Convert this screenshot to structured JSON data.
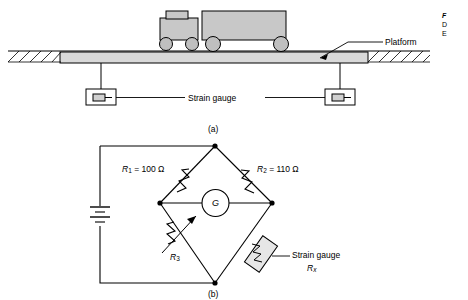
{
  "figure": {
    "part_a": {
      "caption": "(a)",
      "platform_label": "Platform",
      "strain_gauge_label": "Strain gauge"
    },
    "part_b": {
      "caption": "(b)",
      "r1_label": "R",
      "r1_sub": "1",
      "r1_value": " = 100 Ω",
      "r2_label": "R",
      "r2_sub": "2",
      "r2_value": " = 110 Ω",
      "r3_label": "R",
      "r3_sub": "3",
      "galvanometer_label": "G",
      "strain_gauge_label": "Strain gauge",
      "rx_label": "R",
      "rx_sub": "x"
    },
    "margin_note": {
      "line1": "F",
      "line2": "D",
      "line3": "E"
    }
  },
  "colors": {
    "line": "#000000",
    "platform_fill": "#d9d9d9",
    "truck_fill": "#c8c8c8",
    "wheel_fill": "#c0c0c0",
    "resistor_fill": "#e8e8e8",
    "background": "#ffffff"
  }
}
